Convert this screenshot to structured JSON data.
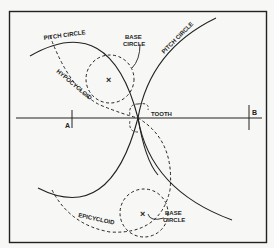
{
  "figure": {
    "type": "gear-tooth-cycloidal-construction",
    "colors": {
      "background": "#f7f7f5",
      "ink": "#222222"
    }
  },
  "labels": {
    "pitch_circle_upper": "PITCH CIRCLE",
    "pitch_circle_right": "PITCH CIRCLE",
    "base_circle_upper": [
      "BASE",
      "CIRCLE"
    ],
    "hypocycloid": "HYPOCYCLOID",
    "tooth": "TOOTH",
    "point_a": "A",
    "point_b": "B",
    "epicycloid": "EPICYCLOID",
    "base_circle_lower": [
      "BASE",
      "CIRCLE"
    ],
    "center_mark": "×"
  }
}
